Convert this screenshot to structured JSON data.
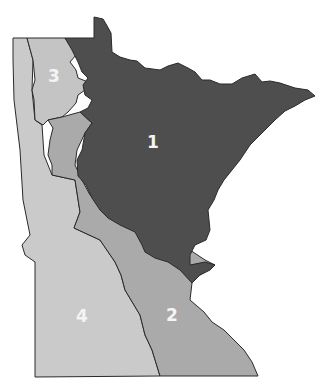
{
  "map": {
    "subject": "Minnesota regions",
    "regions": [
      {
        "id": "1",
        "label": "1",
        "color": "#4f4f4f",
        "label_pos": [
          153,
          142
        ]
      },
      {
        "id": "2",
        "label": "2",
        "color": "#a9a9a9",
        "label_pos": [
          172,
          315
        ]
      },
      {
        "id": "3",
        "label": "3",
        "color": "#c6c6c6",
        "label_pos": [
          54,
          76
        ]
      },
      {
        "id": "4",
        "label": "4",
        "color": "#c9c9c9",
        "label_pos": [
          82,
          316
        ]
      }
    ],
    "border_color": "#2a2a2a",
    "background": "#ffffff"
  }
}
